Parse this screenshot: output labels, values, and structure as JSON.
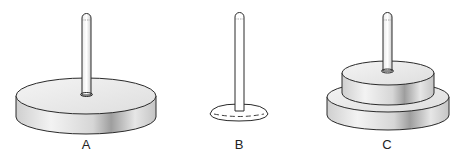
{
  "figure": {
    "pegs": [
      {
        "id": "A",
        "label": "A",
        "discs": 1,
        "center_x": 84
      },
      {
        "id": "B",
        "label": "B",
        "discs": 0,
        "center_x": 239
      },
      {
        "id": "C",
        "label": "C",
        "discs": 2,
        "center_x": 387
      }
    ]
  },
  "colors": {
    "stroke": "#2a2a2a",
    "disc_top": "#ececec",
    "disc_side_light": "#f2f2f2",
    "disc_side_dark": "#a8a8a8",
    "background": "#ffffff"
  }
}
